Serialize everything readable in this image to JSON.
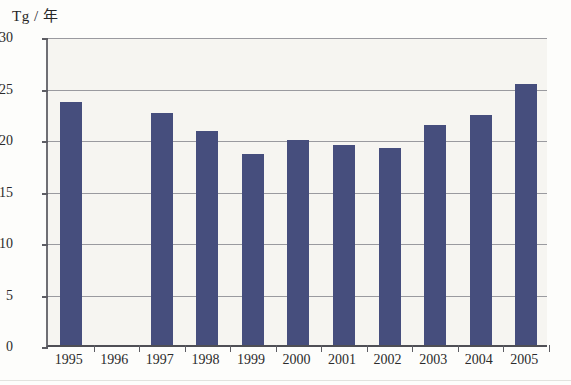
{
  "chart_data": {
    "type": "bar",
    "title": "",
    "subtitle": "",
    "xlabel": "",
    "ylabel": "Tg / 年",
    "ylim": [
      0,
      30
    ],
    "ytick_step": 5,
    "yticks": [
      0,
      5,
      10,
      15,
      20,
      25,
      30
    ],
    "ytick_labels": [
      "0",
      "5",
      "10",
      "15",
      "20",
      "25",
      "30"
    ],
    "grid": true,
    "legend": null,
    "legend_position": "none",
    "categories": [
      "1995",
      "1996",
      "1997",
      "1998",
      "1999",
      "2000",
      "2001",
      "2002",
      "2003",
      "2004",
      "2005"
    ],
    "values": [
      23.6,
      null,
      22.5,
      20.8,
      18.5,
      19.9,
      19.4,
      19.1,
      21.4,
      22.3,
      25.3
    ],
    "missing_categories": [
      "1996"
    ],
    "series": [
      {
        "name": "Tg / 年",
        "values": [
          23.6,
          null,
          22.5,
          20.8,
          18.5,
          19.9,
          19.4,
          19.1,
          21.4,
          22.3,
          25.3
        ]
      }
    ],
    "annotations": []
  },
  "style": {
    "bar_color": "#464e7d",
    "plot_background": "#f6f5f1",
    "page_background": "#fdfdfb",
    "grid_color": "#9a9a9f",
    "axis_color": "#5d5d63",
    "text_color": "#2b2b2b"
  }
}
